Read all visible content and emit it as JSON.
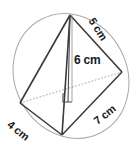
{
  "figure": {
    "type": "triangular-pyramid-tetrahedron",
    "background_color": "#ffffff",
    "line_color": "#3a3a3a",
    "hidden_line_color": "#8f8f8f",
    "ellipse_color": "#9a9a9a",
    "label_color": "#1a1a1a",
    "labels": {
      "slant_edge": "5 cm",
      "height": "6 cm",
      "base_left_edge": "4 cm",
      "base_right_edge": "7 cm"
    },
    "vertices": {
      "apex": {
        "x": 70,
        "y": 15
      },
      "left": {
        "x": 20,
        "y": 103
      },
      "right": {
        "x": 122,
        "y": 72
      },
      "front": {
        "x": 62,
        "y": 135
      },
      "height_foot": {
        "x": 68,
        "y": 102
      }
    },
    "ellipse": {
      "center_x": 71,
      "center_y": 76,
      "radius_x": 56,
      "radius_y": 64,
      "rotation_deg": -28
    },
    "right_angle_marker": {
      "present": true,
      "x": 64,
      "y": 93,
      "size": 9
    }
  }
}
